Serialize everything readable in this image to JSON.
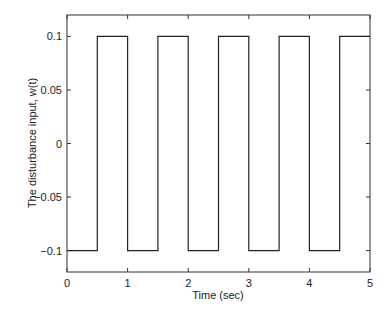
{
  "chart_data": {
    "type": "line",
    "title": "",
    "xlabel": "Time (sec)",
    "ylabel": "The disturbance input, w(t)",
    "xlim": [
      0,
      5
    ],
    "ylim": [
      -0.12,
      0.12
    ],
    "xticks": [
      0,
      1,
      2,
      3,
      4,
      5
    ],
    "xtick_labels": [
      "0",
      "1",
      "2",
      "3",
      "4",
      "5"
    ],
    "yticks": [
      0.1,
      0.05,
      0,
      -0.05,
      -0.1
    ],
    "ytick_labels": [
      "0.1",
      "0.05",
      "0",
      "-0.05",
      "-0.1"
    ],
    "grid": false,
    "legend": null,
    "series": [
      {
        "name": "w(t)",
        "color": "#222222",
        "x": [
          0,
          0.5,
          0.5,
          1.0,
          1.0,
          1.5,
          1.5,
          2.0,
          2.0,
          2.5,
          2.5,
          3.0,
          3.0,
          3.5,
          3.5,
          4.0,
          4.0,
          4.5,
          4.5,
          5.0
        ],
        "y": [
          -0.1,
          -0.1,
          0.1,
          0.1,
          -0.1,
          -0.1,
          0.1,
          0.1,
          -0.1,
          -0.1,
          0.1,
          0.1,
          -0.1,
          -0.1,
          0.1,
          0.1,
          -0.1,
          -0.1,
          0.1,
          0.1
        ]
      }
    ]
  }
}
